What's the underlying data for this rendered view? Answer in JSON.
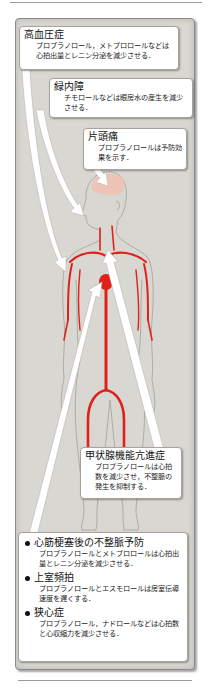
{
  "diagram": {
    "colors": {
      "panel_bg": "#d9d7d1",
      "artery_red": "#e0201a",
      "brain_pink": "#f1c2b4",
      "arrow_white": "#ffffff",
      "outline_gray": "#8a8a8a"
    }
  },
  "callouts": {
    "hypertension": {
      "title": "高血圧症",
      "text": "プロプラノロール，メトプロロールなどは心拍出量とレニン分泌を減少させる．"
    },
    "glaucoma": {
      "title": "緑内障",
      "text": "チモロールなどは眼房水の産生を減少させる．"
    },
    "migraine": {
      "title": "片頭痛",
      "text": "プロプラノロールは予防効果を示す．"
    },
    "hyperthyroidism": {
      "title": "甲状腺機能亢進症",
      "text": "プロプラノロールは心拍数を減少させ，不整脈の発生を抑制する．"
    }
  },
  "bottom_list": [
    {
      "title": "心筋梗塞後の不整脈予防",
      "text": "プロプラノロールとメトプロロールは心拍出量とレニン分泌を減少させる．"
    },
    {
      "title": "上室頻拍",
      "text": "プロプラノロールとエスモロールは房室伝導速度を遅くする．"
    },
    {
      "title": "狭心症",
      "text": "プロプラノロール，ナドロールなどは心拍数と心収縮力を減少させる．"
    }
  ]
}
